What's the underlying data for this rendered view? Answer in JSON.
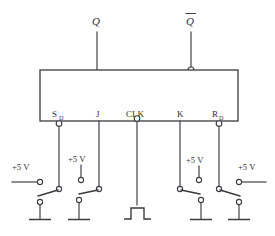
{
  "diagram": {
    "device_box": {
      "label": ""
    },
    "outputs": [
      {
        "name": "Q",
        "label": "Q",
        "overbar": false,
        "x": 97,
        "terminal": "direct"
      },
      {
        "name": "Q-not",
        "label": "Q",
        "overbar": true,
        "x": 191,
        "terminal": "bubble"
      }
    ],
    "pins": [
      {
        "name": "preset",
        "label": "S",
        "subscript": "D",
        "x": 59,
        "bubble": true
      },
      {
        "name": "j-input",
        "label": "J",
        "subscript": "",
        "x": 99,
        "bubble": false
      },
      {
        "name": "clock",
        "label": "CLK",
        "subscript": "",
        "x": 137,
        "bubble": true
      },
      {
        "name": "k-input",
        "label": "K",
        "subscript": "",
        "x": 180,
        "bubble": false
      },
      {
        "name": "clear",
        "label": "R",
        "subscript": "D",
        "x": 219,
        "bubble": true
      }
    ],
    "supply_labels": [
      {
        "for": "preset",
        "text": "+5 V",
        "x": 24,
        "y": 166
      },
      {
        "for": "j-input",
        "text": "+5 V",
        "x": 82,
        "y": 158
      },
      {
        "for": "k-input",
        "text": "+5 V",
        "x": 199,
        "y": 159
      },
      {
        "for": "clear",
        "text": "+5 V",
        "x": 250,
        "y": 166
      }
    ],
    "switches": [
      {
        "for": "preset",
        "pivot_side": "right",
        "blade_direction": "down-left",
        "source": "left-horizontal",
        "ground": true
      },
      {
        "for": "j-input",
        "pivot_side": "right",
        "blade_direction": "down-left",
        "source": "top-vertical",
        "ground": true
      },
      {
        "for": "k-input",
        "pivot_side": "left",
        "blade_direction": "down-right",
        "source": "top-vertical",
        "ground": true
      },
      {
        "for": "clear",
        "pivot_side": "left",
        "blade_direction": "down-right",
        "source": "right-horizontal",
        "ground": true
      }
    ],
    "clock_source": {
      "type": "pulse-waveform",
      "for": "clock"
    },
    "colors": {
      "line": "#3a3a42",
      "text": "#2e2e34",
      "background": "#ffffff"
    }
  }
}
